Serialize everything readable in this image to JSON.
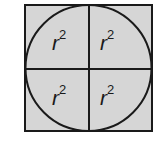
{
  "diagram": {
    "colors": {
      "fill": "#d6d6d6",
      "stroke": "#1a1a1a",
      "background": "#ffffff"
    },
    "square": {
      "x": 25,
      "y": 5,
      "size": 127
    },
    "circle": {
      "cx": 89,
      "cy": 68,
      "r": 63
    },
    "quadrants": [
      {
        "position": "top-left",
        "base": "r",
        "exponent": "2"
      },
      {
        "position": "top-right",
        "base": "r",
        "exponent": "2"
      },
      {
        "position": "bottom-left",
        "base": "r",
        "exponent": "2"
      },
      {
        "position": "bottom-right",
        "base": "r",
        "exponent": "2"
      }
    ],
    "bottom_caption_partial": ". . ."
  }
}
